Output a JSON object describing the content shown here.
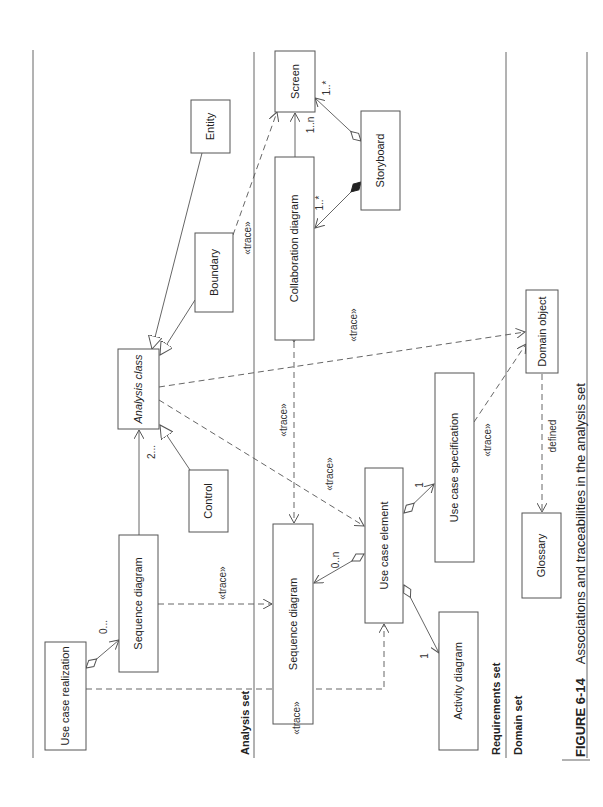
{
  "figure": {
    "caption_number": "FIGURE 6-14",
    "caption_text": "Associations and traceabilities in the analysis set"
  },
  "sets": {
    "analysis": "Analysis set",
    "requirements": "Requirements set",
    "domain": "Domain set"
  },
  "classes": {
    "entity": "Entity",
    "boundary": "Boundary",
    "analysis_class": "Analysis class",
    "control": "Control",
    "sequence_diagram_analysis": "Sequence diagram",
    "use_case_realization": "Use case realization",
    "screen": "Screen",
    "collaboration_diagram": "Collaboration diagram",
    "storyboard": "Storyboard",
    "sequence_diagram_req": "Sequence diagram",
    "use_case_element": "Use case element",
    "use_case_specification": "Use case specification",
    "activity_diagram": "Activity diagram",
    "domain_object": "Domain object",
    "glossary": "Glossary"
  },
  "labels": {
    "trace": "«trace»",
    "defined": "defined",
    "mult_2": "2...",
    "mult_0": "0...",
    "mult_1n": "1..n",
    "mult_1star_a": "1..*",
    "mult_1star_b": "1..*",
    "mult_0n": "0..n",
    "mult_1_spec": "1",
    "mult_1_act": "1"
  }
}
